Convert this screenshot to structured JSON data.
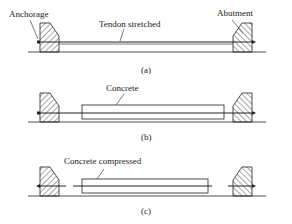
{
  "panels": [
    {
      "id": "a",
      "caption": "(a)",
      "labels": {
        "anchorage": "Anchorage",
        "tendon": "Tendon stretched",
        "abutment": "Abutment"
      }
    },
    {
      "id": "b",
      "caption": "(b)",
      "labels": {
        "concrete": "Concrete"
      }
    },
    {
      "id": "c",
      "caption": "(c)",
      "labels": {
        "concrete": "Concrete compressed"
      }
    }
  ],
  "colors": {
    "line": "#222222",
    "background": "#ffffff"
  }
}
